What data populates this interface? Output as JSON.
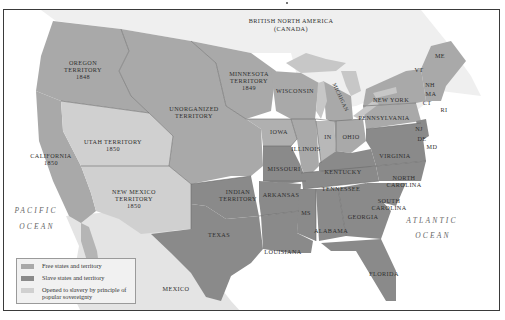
{
  "map": {
    "regions": {
      "british_north_america": "BRITISH NORTH AMERICA",
      "canada": "(CANADA)",
      "oregon": [
        "OREGON",
        "TERRITORY",
        "1848"
      ],
      "minnesota": [
        "MINNESOTA",
        "TERRITORY",
        "1849"
      ],
      "unorganized": [
        "UNORGANIZED",
        "TERRITORY"
      ],
      "utah": [
        "UTAH TERRITORY",
        "1850"
      ],
      "california": [
        "CALIFORNIA",
        "1850"
      ],
      "new_mexico": [
        "NEW MEXICO",
        "TERRITORY",
        "1850"
      ],
      "indian": [
        "INDIAN",
        "TERRITORY"
      ],
      "texas": "TEXAS",
      "mexico": "MEXICO",
      "iowa": "IOWA",
      "wisconsin": "WISCONSIN",
      "michigan": "MICHIGAN",
      "illinois": "ILLINOIS",
      "indiana": "IN",
      "ohio": "OHIO",
      "missouri": "MISSOURI",
      "arkansas": "ARKANSAS",
      "louisiana": "LOUISIANA",
      "mississippi": "MS",
      "alabama": "ALABAMA",
      "georgia": "GEORGIA",
      "florida": "FLORIDA",
      "tennessee": "TENNESSEE",
      "kentucky": "KENTUCKY",
      "virginia": "VIRGINIA",
      "north_carolina": [
        "NORTH",
        "CAROLINA"
      ],
      "south_carolina": [
        "SOUTH",
        "CAROLINA"
      ],
      "new_york": "NEW YORK",
      "pennsylvania": "PENNSYLVANIA",
      "maine": "ME",
      "vermont": "VT",
      "new_hampshire": "NH",
      "massachusetts": "MA",
      "connecticut": "CT",
      "rhode_island": "RI",
      "new_jersey": "NJ",
      "delaware": "DE",
      "maryland": "MD"
    },
    "oceans": {
      "pacific": [
        "PACIFIC",
        "OCEAN"
      ],
      "atlantic": [
        "ATLANTIC",
        "OCEAN"
      ]
    },
    "colors": {
      "free": "#a9a9a9",
      "slave": "#8a8a8a",
      "open": "#d0d0d0"
    }
  },
  "legend": {
    "items": [
      {
        "label": "Free states and territory",
        "color": "#a9a9a9"
      },
      {
        "label": "Slave states and territory",
        "color": "#8a8a8a"
      },
      {
        "label": "Opened to slavery by principle of popular sovereignty",
        "color": "#d0d0d0"
      }
    ]
  }
}
